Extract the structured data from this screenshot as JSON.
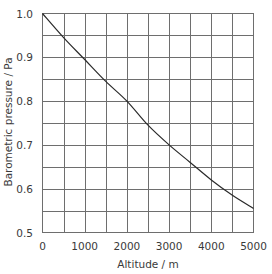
{
  "chart_data": {
    "type": "line",
    "title": "",
    "xlabel": "Altitude / m",
    "ylabel": "Barometric pressure / Pa",
    "xlim": [
      0,
      5000
    ],
    "ylim": [
      0.5,
      1.0
    ],
    "grid": true,
    "legend": null,
    "x_ticks": [
      0,
      1000,
      2000,
      3000,
      4000,
      5000
    ],
    "x_tick_labels": [
      "0",
      "1000",
      "2000",
      "3000",
      "4000",
      "5000"
    ],
    "y_ticks": [
      0.5,
      0.6,
      0.7,
      0.8,
      0.9,
      1.0
    ],
    "y_tick_labels": [
      "0.5",
      "0.6",
      "0.7",
      "0.8",
      "0.9",
      "1.0"
    ],
    "x_grid_step": 500,
    "y_grid_step": 0.05,
    "series": [
      {
        "name": "Barometric pressure",
        "x": [
          0,
          500,
          1000,
          1500,
          2000,
          2500,
          3000,
          3500,
          4000,
          4500,
          5000
        ],
        "values": [
          1.0,
          0.945,
          0.895,
          0.845,
          0.8,
          0.745,
          0.7,
          0.66,
          0.62,
          0.585,
          0.555
        ]
      }
    ]
  }
}
